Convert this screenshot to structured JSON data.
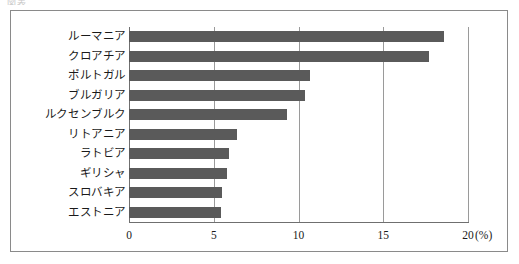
{
  "top_caption": "図表",
  "chart_data": {
    "type": "bar",
    "orientation": "horizontal",
    "title": "",
    "subtitle": "",
    "xlabel": "(%)",
    "ylabel": "",
    "xlim": [
      0,
      20
    ],
    "grid": true,
    "legend": null,
    "bar_color": "#5a5a5a",
    "axis_color": "#6f6f6f",
    "gridline_color": "#9a9a9a",
    "frame_color": "#8a8a8a",
    "xticks": [
      "0",
      "5",
      "10",
      "15",
      "20"
    ],
    "xtick_values": [
      0,
      5,
      10,
      15,
      20
    ],
    "unit_label": "(%)",
    "categories": [
      "ルーマニア",
      "クロアチア",
      "ポルトガル",
      "ブルガリア",
      "ルクセンブルク",
      "リトアニア",
      "ラトビア",
      "ギリシャ",
      "スロバキア",
      "エストニア"
    ],
    "values": [
      18.6,
      17.7,
      10.7,
      10.4,
      9.3,
      6.4,
      5.9,
      5.8,
      5.5,
      5.4
    ]
  }
}
